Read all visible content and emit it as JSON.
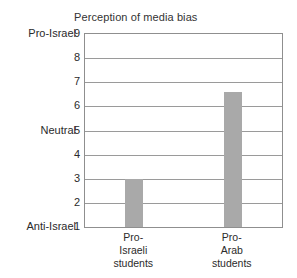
{
  "chart_data": {
    "type": "bar",
    "title": "Perception of media bias",
    "xlabel": "",
    "ylabel": "",
    "categories": [
      "Pro-Israeli students",
      "Pro-Arab students"
    ],
    "category_lines": [
      [
        "Pro-",
        "Israeli",
        "students"
      ],
      [
        "Pro-",
        "Arab",
        "students"
      ]
    ],
    "values": [
      3.0,
      6.6
    ],
    "ylim": [
      1,
      9
    ],
    "yticks": [
      1,
      2,
      3,
      4,
      5,
      6,
      7,
      8,
      9
    ],
    "ytick_labels": [
      "1",
      "2",
      "3",
      "4",
      "5",
      "6",
      "7",
      "8",
      "9"
    ],
    "y_anchor_labels": [
      {
        "value": 9,
        "label": "Pro-Israel"
      },
      {
        "value": 5,
        "label": "Neutral"
      },
      {
        "value": 1,
        "label": "Anti-Israel"
      }
    ],
    "grid": true,
    "legend": false,
    "bar_color": "#a9a9a9",
    "grid_color": "#9a9a9a",
    "frame_color": "#8f8f8f",
    "background": "#ffffff"
  }
}
